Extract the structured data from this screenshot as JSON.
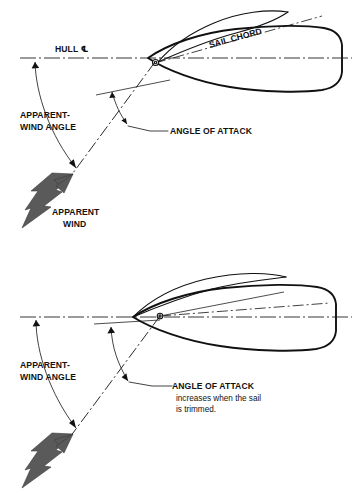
{
  "figure": {
    "type": "technical-line-diagram",
    "panels": [
      {
        "id": "panel-top",
        "name": "sail-eased",
        "labels": {
          "hull_centerline": "HULL ℄",
          "sail_chord": "SAIL CHORD",
          "apparent_wind_angle": "APPARENT-\nWIND ANGLE",
          "apparent_wind_angle_line1": "APPARENT-",
          "apparent_wind_angle_line2": "WIND ANGLE",
          "angle_of_attack": "ANGLE OF ATTACK",
          "apparent_wind_line1": "APPARENT",
          "apparent_wind_line2": "WIND"
        }
      },
      {
        "id": "panel-bottom",
        "name": "sail-trimmed",
        "labels": {
          "apparent_wind_angle_line1": "APPARENT-",
          "apparent_wind_angle_line2": "WIND ANGLE",
          "angle_of_attack": "ANGLE OF ATTACK",
          "angle_of_attack_note_line1": "increases when the sail",
          "angle_of_attack_note_line2": "is trimmed."
        }
      }
    ],
    "caption": "",
    "colors": {
      "ink": "#111111",
      "wind_arrow_fill": "#5a5a5a",
      "wind_arrow_stroke": "#3a3a3a",
      "background": "#ffffff",
      "caption_ghost": "#bfbfbf"
    }
  }
}
